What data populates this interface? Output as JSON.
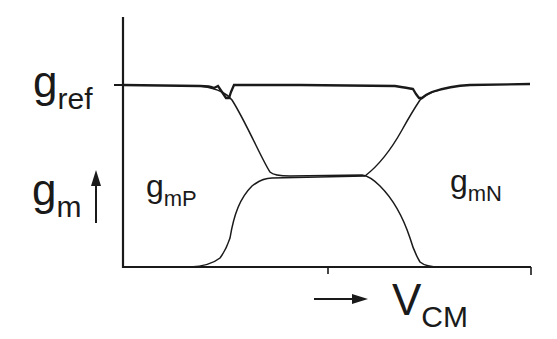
{
  "diagram": {
    "type": "transconductance-vs-common-mode-voltage",
    "y_axis": {
      "label_main": "g",
      "label_sub": "m",
      "arrow": "up-arrow",
      "reference_level": {
        "main": "g",
        "sub": "ref"
      }
    },
    "x_axis": {
      "label_main": "V",
      "label_sub": "CM",
      "arrow": "right-arrow"
    },
    "curves": [
      {
        "name": "gmP",
        "label_main": "g",
        "label_sub": "mP",
        "description": "P-channel pair transconductance, high at low VCM, falling to mid level"
      },
      {
        "name": "gmN",
        "label_main": "g",
        "label_sub": "mN",
        "description": "N-channel pair transconductance, rising from zero to mid level, then to gref at high VCM"
      },
      {
        "name": "gtotal",
        "description": "Total transconductance, nearly constant at gref with small dips at transitions"
      }
    ],
    "colors": {
      "line": "#1a1a1a",
      "background": "#ffffff"
    }
  }
}
